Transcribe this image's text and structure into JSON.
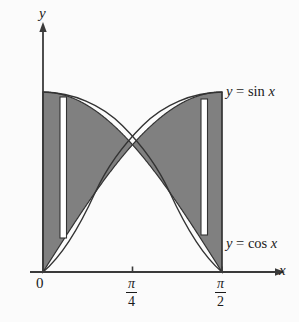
{
  "figure": {
    "axes": {
      "x_axis_name": "x",
      "y_axis_name": "y",
      "x_ticks": [
        {
          "name": "origin",
          "label": "0"
        },
        {
          "name": "pi-over-4",
          "numerator": "π",
          "denominator": "4"
        },
        {
          "name": "pi-over-2",
          "numerator": "π",
          "denominator": "2"
        }
      ]
    },
    "curve_labels": {
      "sine": {
        "lhs": "y",
        "eq": " = ",
        "fn": "sin",
        "arg": "x"
      },
      "cosine": {
        "lhs": "y",
        "eq": " = ",
        "fn": "cos",
        "arg": "x"
      }
    },
    "colors": {
      "shaded_region": "#808080",
      "outline": "#333333",
      "axis": "#3a3a3a",
      "background": "#fbfbfb",
      "rectangle_fill": "#ffffff"
    }
  },
  "chart_data": {
    "type": "area",
    "xlabel": "x",
    "ylabel": "y",
    "xlim": [
      0,
      1.5707963
    ],
    "ylim": [
      0,
      1
    ],
    "grid": false,
    "legend": "inline curve labels at right",
    "x_tick_values": [
      0,
      0.7853982,
      1.5707963
    ],
    "x_tick_labels": [
      "0",
      "π/4",
      "π/2"
    ],
    "series": [
      {
        "name": "y = sin x",
        "x": [
          0,
          0.19635,
          0.3927,
          0.58905,
          0.7853982,
          0.98175,
          1.1781,
          1.37445,
          1.5707963
        ],
        "values": [
          0,
          0.19509,
          0.38268,
          0.55557,
          0.70711,
          0.83147,
          0.92388,
          0.98079,
          1.0
        ]
      },
      {
        "name": "y = cos x",
        "x": [
          0,
          0.19635,
          0.3927,
          0.58905,
          0.7853982,
          0.98175,
          1.1781,
          1.37445,
          1.5707963
        ],
        "values": [
          1.0,
          0.98079,
          0.92388,
          0.83147,
          0.70711,
          0.55557,
          0.38268,
          0.19509,
          0.0
        ]
      }
    ],
    "shaded_between": [
      "y = sin x",
      "y = cos x"
    ],
    "intersection_point": {
      "x": 0.7853982,
      "y": 0.70711
    },
    "representative_rectangles": [
      {
        "name": "left-rectangle",
        "x_center": 0.13,
        "top_curve": "y = cos x",
        "bottom_curve": "y = sin x"
      },
      {
        "name": "right-rectangle",
        "x_center": 1.37,
        "top_curve": "y = sin x",
        "bottom_curve": "y = cos x"
      }
    ]
  }
}
